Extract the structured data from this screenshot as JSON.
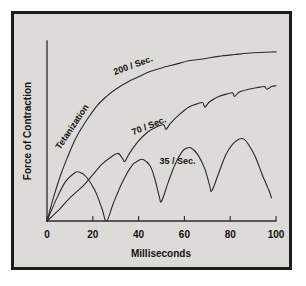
{
  "figure": {
    "background_color": "#dddbd8",
    "frame_color": "#1c1c1c",
    "ink_color": "#2b2b2b"
  },
  "chart_data": {
    "type": "line",
    "title": "",
    "xlabel": "Milliseconds",
    "ylabel": "Force of Contraction",
    "xlim": [
      0,
      100
    ],
    "ylim": [
      0,
      100
    ],
    "xticks": [
      0,
      20,
      40,
      60,
      80,
      100
    ],
    "xtick_labels": [
      "0",
      "20",
      "40",
      "60",
      "80",
      "100"
    ],
    "yticks": [],
    "ytick_labels": [],
    "grid": false,
    "legend": "inline-curve-labels",
    "annotations": [
      {
        "text": "Tetanization",
        "rotation": -56,
        "x_ms": 12,
        "y_frac": 0.52
      },
      {
        "text": "200 / Sec.",
        "rotation": -20,
        "x_ms": 38,
        "y_frac": 0.86
      },
      {
        "text": "70 / Sec.",
        "rotation": -22,
        "x_ms": 45,
        "y_frac": 0.52
      },
      {
        "text": "35 / Sec.",
        "rotation": 0,
        "x_ms": 57,
        "y_frac": 0.32
      }
    ],
    "series": [
      {
        "name": "200 / Sec.",
        "label": "200 / Sec.",
        "description": "Smooth fused tetanus — force rises asymptotically to maximum with no ripple",
        "points": [
          [
            0,
            0
          ],
          [
            3,
            14
          ],
          [
            6,
            26
          ],
          [
            9,
            36
          ],
          [
            12,
            45
          ],
          [
            15,
            52
          ],
          [
            18,
            58
          ],
          [
            22,
            65
          ],
          [
            26,
            70
          ],
          [
            30,
            74
          ],
          [
            35,
            78
          ],
          [
            40,
            81
          ],
          [
            45,
            84
          ],
          [
            50,
            86
          ],
          [
            56,
            88
          ],
          [
            62,
            90
          ],
          [
            68,
            91
          ],
          [
            75,
            92.5
          ],
          [
            82,
            93.5
          ],
          [
            90,
            94.5
          ],
          [
            100,
            95
          ]
        ]
      },
      {
        "name": "70 / Sec.",
        "label": "70 / Sec.",
        "description": "Incomplete tetanus — summating contractions with small ripples on a rising baseline",
        "points": [
          [
            0,
            0
          ],
          [
            5,
            6
          ],
          [
            10,
            13
          ],
          [
            16,
            20
          ],
          [
            20,
            26
          ],
          [
            24,
            32
          ],
          [
            28,
            36
          ],
          [
            31,
            38
          ],
          [
            33,
            35
          ],
          [
            34,
            33.5
          ],
          [
            36,
            38
          ],
          [
            40,
            45
          ],
          [
            44,
            50
          ],
          [
            48,
            53
          ],
          [
            51,
            54
          ],
          [
            52,
            51.5
          ],
          [
            54,
            55
          ],
          [
            58,
            60
          ],
          [
            62,
            64
          ],
          [
            66,
            66
          ],
          [
            68,
            66.5
          ],
          [
            69,
            64
          ],
          [
            71,
            67
          ],
          [
            75,
            70
          ],
          [
            79,
            71.5
          ],
          [
            81,
            72
          ],
          [
            82,
            70
          ],
          [
            84,
            72.5
          ],
          [
            88,
            74
          ],
          [
            92,
            75
          ],
          [
            95,
            75.5
          ],
          [
            96,
            74
          ],
          [
            98,
            75.5
          ],
          [
            100,
            76
          ]
        ]
      },
      {
        "name": "35 / Sec.",
        "label": "35 / Sec.",
        "description": "Separate twitches summating — each twitch peaks higher, troughs rise above baseline after the first",
        "points": [
          [
            0,
            0
          ],
          [
            4,
            12
          ],
          [
            8,
            22
          ],
          [
            12,
            27
          ],
          [
            14,
            27.5
          ],
          [
            17,
            25
          ],
          [
            21,
            17
          ],
          [
            24,
            7
          ],
          [
            26,
            0
          ],
          [
            29,
            10
          ],
          [
            33,
            22
          ],
          [
            37,
            31
          ],
          [
            40,
            34
          ],
          [
            42,
            34.5
          ],
          [
            45,
            31
          ],
          [
            47,
            24
          ],
          [
            49,
            14
          ],
          [
            50,
            11
          ],
          [
            53,
            22
          ],
          [
            56,
            32
          ],
          [
            59,
            39
          ],
          [
            61,
            41
          ],
          [
            63,
            41
          ],
          [
            66,
            37
          ],
          [
            69,
            29
          ],
          [
            71,
            20
          ],
          [
            72,
            17
          ],
          [
            75,
            27
          ],
          [
            78,
            37
          ],
          [
            81,
            43
          ],
          [
            84,
            46
          ],
          [
            86,
            46
          ],
          [
            88,
            43
          ],
          [
            91,
            36
          ],
          [
            94,
            26
          ],
          [
            97,
            17
          ],
          [
            98,
            13
          ]
        ]
      }
    ]
  },
  "axes": {
    "x_axis_name": "milliseconds-axis",
    "y_axis_name": "force-axis"
  }
}
